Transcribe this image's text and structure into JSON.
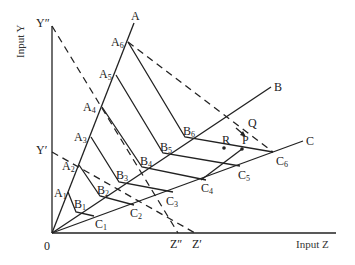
{
  "axes": {
    "x_title": "Input Z",
    "y_title": "Input Y",
    "origin": "0"
  },
  "rays": [
    {
      "id": "A",
      "label": "A"
    },
    {
      "id": "B",
      "label": "B"
    },
    {
      "id": "C",
      "label": "C"
    }
  ],
  "points": {
    "A": [
      "A",
      "1",
      "2",
      "3",
      "4",
      "5",
      "6"
    ],
    "B": [
      "B",
      "1",
      "2",
      "3",
      "4",
      "5",
      "6"
    ],
    "C": [
      "C",
      "1",
      "2",
      "3",
      "4",
      "5",
      "6"
    ]
  },
  "isocost_labels": {
    "y_prime": "Y′",
    "y_double_prime": "Y″",
    "z_prime": "Z′",
    "z_double_prime": "Z″"
  },
  "marked_points": {
    "p": "P",
    "q": "Q",
    "r": "R"
  },
  "colors": {
    "line": "#222222",
    "background": "#ffffff"
  }
}
